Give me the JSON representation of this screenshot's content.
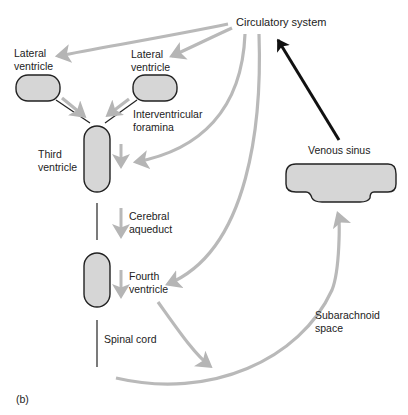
{
  "figure_label": "(b)",
  "colors": {
    "chamber_fill": "#d6d6d6",
    "chamber_stroke": "#222222",
    "flow_arrow": "#b9b9b9",
    "return_arrow": "#111111"
  },
  "labels": {
    "circulatory_system": "Circulatory system",
    "lateral_ventricle_left": "Lateral\nventricle",
    "lateral_ventricle_right": "Lateral\nventricle",
    "interventricular_foramina": "Interventricular\nforamina",
    "third_ventricle": "Third\nventricle",
    "cerebral_aqueduct": "Cerebral\naqueduct",
    "fourth_ventricle": "Fourth\nventricle",
    "spinal_cord": "Spinal cord",
    "venous_sinus": "Venous sinus",
    "subarachnoid_space": "Subarachnoid\nspace"
  },
  "nodes": [
    {
      "id": "circulatory_system",
      "label": "Circulatory system"
    },
    {
      "id": "lateral_ventricle_left",
      "label": "Lateral ventricle"
    },
    {
      "id": "lateral_ventricle_right",
      "label": "Lateral ventricle"
    },
    {
      "id": "third_ventricle",
      "label": "Third ventricle"
    },
    {
      "id": "fourth_ventricle",
      "label": "Fourth ventricle"
    },
    {
      "id": "subarachnoid_space",
      "label": "Subarachnoid space"
    },
    {
      "id": "venous_sinus",
      "label": "Venous sinus"
    }
  ],
  "edges": [
    {
      "from": "circulatory_system",
      "to": "lateral_ventricle_left"
    },
    {
      "from": "circulatory_system",
      "to": "lateral_ventricle_right"
    },
    {
      "from": "circulatory_system",
      "to": "third_ventricle"
    },
    {
      "from": "circulatory_system",
      "to": "fourth_ventricle"
    },
    {
      "from": "lateral_ventricle_left",
      "to": "third_ventricle",
      "via": "Interventricular foramina"
    },
    {
      "from": "lateral_ventricle_right",
      "to": "third_ventricle",
      "via": "Interventricular foramina"
    },
    {
      "from": "third_ventricle",
      "to": "fourth_ventricle",
      "via": "Cerebral aqueduct"
    },
    {
      "from": "fourth_ventricle",
      "to": "subarachnoid_space"
    },
    {
      "from": "subarachnoid_space",
      "to": "venous_sinus"
    },
    {
      "from": "venous_sinus",
      "to": "circulatory_system",
      "style": "dark"
    }
  ]
}
